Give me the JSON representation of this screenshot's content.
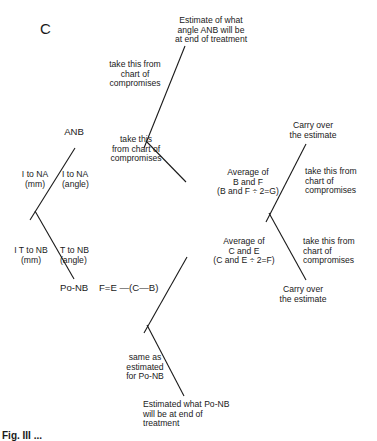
{
  "figure": {
    "panel_letter": "C",
    "caption": "Fig. III ..."
  },
  "top_tree": {
    "result_label": "Estimate of what\nangle ANB will be\nat end of treatment",
    "upper_branch_label": "take this from\nchart of\ncompromises",
    "lower_branch_label": "take this\nfrom chart of\ncompromises"
  },
  "left_tree": {
    "root_label": "ANB",
    "upper_left_label": "I to NA\n(mm)",
    "upper_right_label": "I to NA\n(angle)",
    "lower_left_label": "I T to NB\n(mm)",
    "lower_right_label": "T to NB\n(angle)",
    "bottom_label": "Po-NB",
    "formula": "F=E —(C—B)"
  },
  "right_tree": {
    "top_label": "Carry over\nthe estimate",
    "upper_left_label": "Average of\nB and F\n(B and F ÷ 2=G)",
    "upper_right_label": "take this from\nchart of\ncompromises",
    "lower_left_label": "Average of\nC and E\n(C and E ÷ 2=F)",
    "lower_right_label": "take this from\nchart of\ncompromises",
    "bottom_label": "Carry over\nthe estimate"
  },
  "bottom_tree": {
    "branch_label": "same as\nestimated\nfor Po-NB",
    "result_label": "Estimated what Po-NB\nwill be at end of\ntreatment"
  },
  "colors": {
    "ink": "#1a1a1a",
    "background": "#ffffff"
  }
}
